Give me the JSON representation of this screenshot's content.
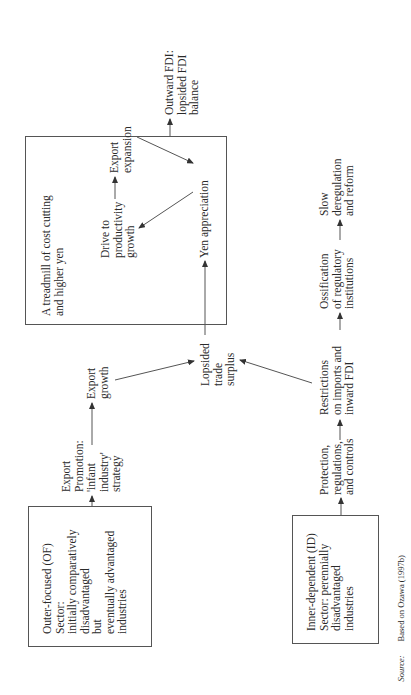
{
  "diagram": {
    "orientation": "rotated 90 degrees counter-clockwise",
    "of_box": {
      "label": "Outer-focused (OF)\nSector:\ninitially comparatively\ndisadvantaged\nbut\neventually advantaged\nindustries"
    },
    "id_box": {
      "label": "Inner-dependent (ID)\nSector: perennially\ndisadvantaged\nindustries"
    },
    "export_promotion": "Export\nPromotion:\n'infant\nindustry'\nstrategy",
    "export_growth": "Export\ngrowth",
    "protection": "Protection,\nregulations,\nand controls",
    "restrictions": "Restrictions\non imports and\ninward FDI",
    "ossification": "Ossification\nof regulatory\ninstitutions",
    "slow_dereg": "Slow\nderegulation\nand reform",
    "lopsided_trade": "Lopsided\ntrade\nsurplus",
    "treadmill_box": {
      "title": "A treadmill of cost cutting\nand higher yen",
      "drive": "Drive to\nproductivity\ngrowth",
      "export_expansion": "Export\nexpansion",
      "yen_appreciation": "Yen appreciation"
    },
    "outward_fdi": "Outward FDI:\nlopsided FDI\nbalance",
    "source": {
      "label": "Source:",
      "text": "Based on Ozawa (1997b)"
    }
  },
  "colors": {
    "line": "#555555",
    "text": "#2a2a2a",
    "background": "#ffffff"
  }
}
